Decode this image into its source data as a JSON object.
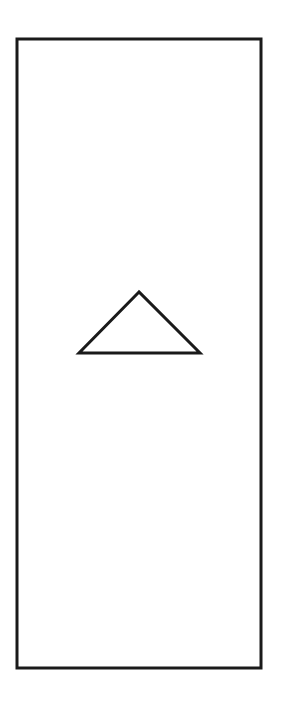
{
  "diagram": {
    "background": "#ffffff",
    "stroke_color": "#1a1a1a",
    "shapes": [
      {
        "type": "rectangle",
        "name": "outer-frame",
        "x": 17,
        "y": 39,
        "width": 244,
        "height": 629,
        "stroke_width": 3
      },
      {
        "type": "triangle",
        "name": "up-arrow-triangle",
        "points": "139,292 79,353 200,353",
        "stroke_width": 3
      }
    ]
  }
}
